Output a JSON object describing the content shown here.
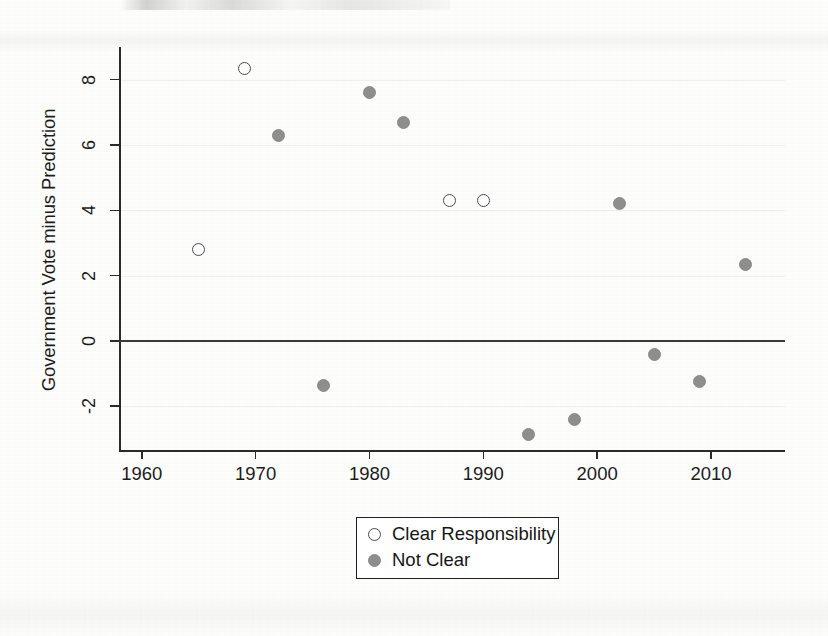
{
  "chart_data": {
    "type": "scatter",
    "title": "",
    "xlabel": "",
    "ylabel": "Government Vote minus Prediction",
    "xlim": [
      1958,
      2016.5
    ],
    "ylim": [
      -3.4,
      9.0
    ],
    "xticks": [
      1960,
      1970,
      1980,
      1990,
      2000,
      2010
    ],
    "xtick_labels": [
      "1960",
      "1970",
      "1980",
      "1990",
      "2000",
      "2010"
    ],
    "yticks": [
      -2,
      0,
      2,
      4,
      6,
      8
    ],
    "ytick_labels": [
      "-2",
      "0",
      "2",
      "4",
      "6",
      "8"
    ],
    "grid": false,
    "reference_lines": [
      {
        "axis": "y",
        "value": 0
      }
    ],
    "legend_position": "below-center",
    "series": [
      {
        "name": "Clear Responsibility",
        "marker": "open-circle",
        "color": "#ffffff",
        "edge_color": "#4a4a4a",
        "points": [
          {
            "x": 1965,
            "y": 2.8
          },
          {
            "x": 1969,
            "y": 8.35
          },
          {
            "x": 1987,
            "y": 4.3
          },
          {
            "x": 1990,
            "y": 4.3
          }
        ]
      },
      {
        "name": "Not Clear",
        "marker": "filled-circle",
        "color": "#8e8e8e",
        "edge_color": "#8a8a8a",
        "points": [
          {
            "x": 1972,
            "y": 6.3
          },
          {
            "x": 1976,
            "y": -1.35
          },
          {
            "x": 1980,
            "y": 7.6
          },
          {
            "x": 1983,
            "y": 6.7
          },
          {
            "x": 1994,
            "y": -2.85
          },
          {
            "x": 1998,
            "y": -2.4
          },
          {
            "x": 2002,
            "y": 4.2
          },
          {
            "x": 2005,
            "y": -0.4
          },
          {
            "x": 2009,
            "y": -1.25
          },
          {
            "x": 2013,
            "y": 2.35
          }
        ]
      }
    ]
  },
  "legend": {
    "entries": [
      {
        "label": "Clear Responsibility",
        "marker": "open-circle"
      },
      {
        "label": "Not Clear",
        "marker": "filled-circle"
      }
    ]
  },
  "colors": {
    "axis": "#2a2a2a",
    "zero_line": "#3a3a3a",
    "marker_fill": "#8e8e8e",
    "marker_edge": "#4a4a4a",
    "text": "#1b1b1b",
    "background": "#fdfdfc"
  }
}
